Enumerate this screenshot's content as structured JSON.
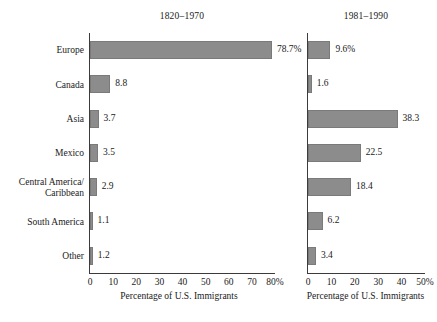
{
  "chart_data": {
    "type": "bar",
    "orientation": "horizontal",
    "title": "",
    "categories": [
      "Europe",
      "Canada",
      "Asia",
      "Mexico",
      "Central America/\nCaribbean",
      "South America",
      "Other"
    ],
    "panels": [
      {
        "title": "1820–1970",
        "xlabel": "Percentage of U.S. Immigrants",
        "xlim": [
          0,
          80
        ],
        "xticks": [
          0,
          10,
          20,
          30,
          40,
          50,
          60,
          70,
          80
        ],
        "xtick_labels": [
          "0",
          "10",
          "20",
          "30",
          "40",
          "50",
          "60",
          "70",
          "80%"
        ],
        "values": [
          78.7,
          8.8,
          3.7,
          3.5,
          2.9,
          1.1,
          1.2
        ],
        "value_labels": [
          "78.7%",
          "8.8",
          "3.7",
          "3.5",
          "2.9",
          "1.1",
          "1.2"
        ],
        "grid": false
      },
      {
        "title": "1981–1990",
        "xlabel": "Percentage of U.S. Immigrants",
        "xlim": [
          0,
          50
        ],
        "xticks": [
          0,
          10,
          20,
          30,
          40,
          50
        ],
        "xtick_labels": [
          "0",
          "10",
          "20",
          "30",
          "40",
          "50%"
        ],
        "values": [
          9.6,
          1.6,
          38.3,
          22.5,
          18.4,
          6.2,
          3.4
        ],
        "value_labels": [
          "9.6%",
          "1.6",
          "38.3",
          "22.5",
          "18.4",
          "6.2",
          "3.4"
        ],
        "grid": false
      }
    ],
    "bar_color": "#8c8c8c",
    "background": "#ffffff",
    "legend": null
  }
}
